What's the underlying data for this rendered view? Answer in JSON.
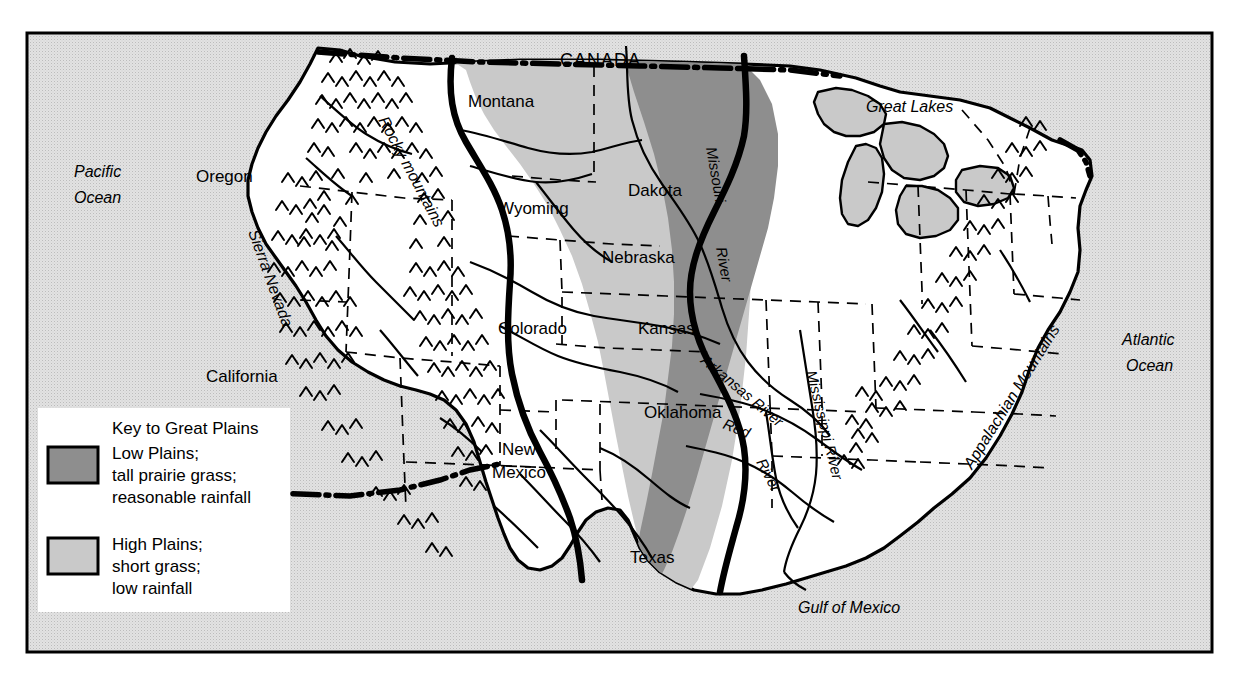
{
  "map": {
    "title_region": "United States — Great Plains",
    "frame": {
      "x": 27,
      "y": 33,
      "width": 1185,
      "height": 619
    },
    "colors": {
      "ocean": "#dcdcdc",
      "land": "#ffffff",
      "high_plains": "#c9c9c9",
      "low_plains": "#8e8e8e",
      "lakes": "#c9c9c9",
      "ink": "#000000",
      "legend_bg": "#ffffff"
    }
  },
  "legend": {
    "title": "Key to Great Plains",
    "entries": [
      {
        "swatch": "#8e8e8e",
        "line1": "Low Plains;",
        "line2": "tall prairie grass;",
        "line3": "reasonable rainfall"
      },
      {
        "swatch": "#c9c9c9",
        "line1": "High Plains;",
        "line2": "short grass;",
        "line3": "low rainfall"
      }
    ]
  },
  "labels": {
    "country": "CANADA",
    "oceans": [
      {
        "line1": "Pacific",
        "line2": "Ocean"
      },
      {
        "line1": "Atlantic",
        "line2": "Ocean"
      },
      {
        "line1": "Gulf of Mexico",
        "line2": ""
      }
    ],
    "great_lakes": "Great Lakes",
    "states": [
      "Montana",
      "Oregon",
      "Wyoming",
      "Dakota",
      "Nebraska",
      "Colorado",
      "Kansas",
      "California",
      "Oklahoma",
      "New Mexico",
      "Texas"
    ],
    "state_parts": {
      "new_mexico_line1": "New",
      "new_mexico_line2": "Mexico"
    },
    "mountains": [
      "Rocky mountains",
      "Sierra Nevada",
      "Appalachian Mountains"
    ],
    "rivers": [
      "Missouri",
      "River",
      "Arkansas River",
      "Red",
      "River",
      "Mississippi River"
    ],
    "river_named": {
      "missouri_word1": "Missouri",
      "missouri_word2": "River",
      "arkansas": "Arkansas River",
      "red_word1": "Red",
      "red_word2": "River",
      "mississippi": "Mississippi River"
    }
  }
}
